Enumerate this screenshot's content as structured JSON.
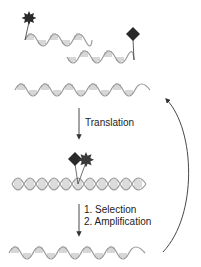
{
  "diagram": {
    "title": "",
    "colors": {
      "helix": "#9a9a9a",
      "rungs": "#8c8c8c",
      "marker": "#2a2a2a",
      "arrow": "#333333",
      "text": "#222222"
    },
    "nodes": [
      {
        "id": "library",
        "description": "Two single-stranded nucleic acid templates with attached star and diamond molecules"
      },
      {
        "id": "template",
        "description": "Single-stranded nucleic acid template"
      },
      {
        "id": "complex",
        "description": "Double-stranded complex with both star and diamond molecules bound"
      },
      {
        "id": "amplified",
        "description": "Amplified single-stranded template"
      }
    ],
    "steps": {
      "translation": "Translation",
      "selection": "1. Selection",
      "amplification": "2. Amplification"
    },
    "icons": {
      "star": "star-molecule-icon",
      "diamond": "diamond-molecule-icon"
    }
  }
}
